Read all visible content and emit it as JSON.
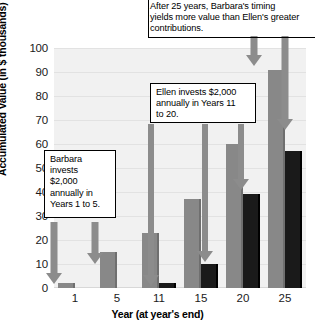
{
  "chart_data": {
    "type": "bar",
    "title": "",
    "subtitle": "",
    "xlabel": "Year (at year's end)",
    "ylabel": "Accumulated Value (in $ thousands)",
    "categories": [
      "1",
      "5",
      "11",
      "15",
      "20",
      "25"
    ],
    "ylim": [
      0,
      100
    ],
    "yticks": [
      0,
      10,
      20,
      30,
      40,
      50,
      60,
      70,
      80,
      90,
      100
    ],
    "grid": true,
    "legend": "none",
    "series": [
      {
        "name": "Barbara",
        "color": "#888888",
        "values": [
          2,
          15,
          23,
          37,
          60,
          91
        ]
      },
      {
        "name": "Ellen",
        "color": "#1a1a1a",
        "values": [
          0,
          0,
          2,
          10,
          39,
          57
        ]
      }
    ],
    "annotations": [
      {
        "id": "top-note",
        "text": "After 25 years, Barbara's timing yields more value than Ellen's greater contributions.",
        "lines": [
          "After 25 years, Barbara's timing",
          "yields more value than Ellen's greater",
          "contributions."
        ],
        "points_to": "Year 25 bars"
      },
      {
        "id": "ellen-note",
        "text": "Ellen invests $2,000 annually in Years 11 to 20.",
        "lines": [
          "Ellen invests $2,000",
          "annually in Years 11",
          "to 20."
        ],
        "points_to": "Ellen bars at Years 11, 15, 20"
      },
      {
        "id": "barbara-note",
        "text": "Barbara invests $2,000 annually in Years 1 to 5.",
        "lines": [
          "Barbara",
          "invests",
          "$2,000",
          "annually in",
          "Years 1 to 5."
        ],
        "points_to": "Barbara bars at Years 1 and 5"
      }
    ]
  },
  "colors": {
    "series_a": "#888888",
    "series_b": "#1a1a1a",
    "arrow": "#8c8c8c",
    "plot_background": "#f1f1f1",
    "gridline": "#e2e2e2"
  }
}
